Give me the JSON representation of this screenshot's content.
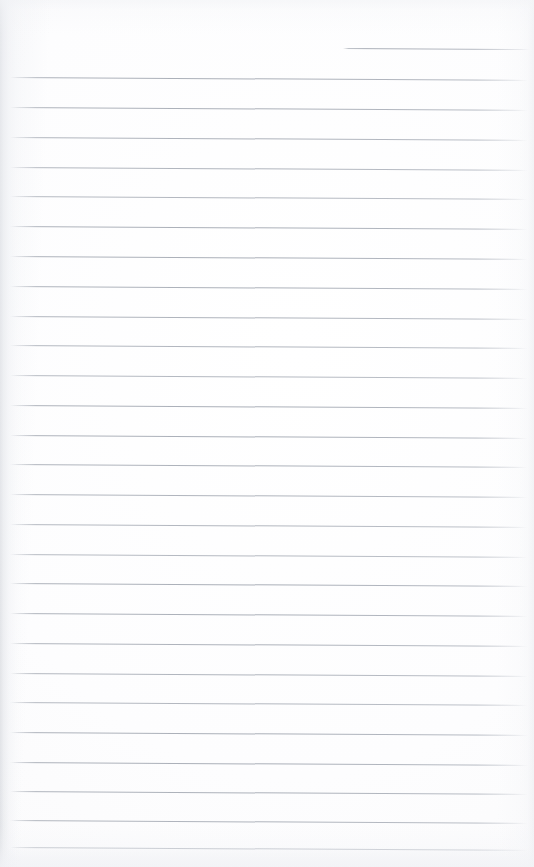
{
  "document": {
    "kind": "scanned-blank-ruled-notebook-page",
    "title": "Blank ruled notebook page",
    "has_visible_text": false,
    "written_content": "",
    "page_width": 534,
    "page_height": 867
  },
  "colors": {
    "paper": "#fdfdfe",
    "paper_edge": "#f8f8fa",
    "rule_line": "#aaafb8",
    "rule_line_faded": "#c4c7cd",
    "spine_shadow": "#c4c7cd"
  },
  "ruling": {
    "style": "wide-ruled-horizontal",
    "line_count": 27,
    "line_spacing_px": 30,
    "first_full_line_y": 77,
    "last_full_line_y": 847,
    "line_left_x": 10,
    "line_right_x": 528,
    "line_thickness_px": 1,
    "skew_px_over_width": 3,
    "lines": [
      {
        "y": 48,
        "left": 343,
        "right": 530,
        "partial": true
      },
      {
        "y": 77,
        "left": 10,
        "right": 528,
        "partial": false
      },
      {
        "y": 107,
        "left": 10,
        "right": 528,
        "partial": false
      },
      {
        "y": 137,
        "left": 10,
        "right": 528,
        "partial": false
      },
      {
        "y": 167,
        "left": 10,
        "right": 528,
        "partial": false
      },
      {
        "y": 196,
        "left": 10,
        "right": 528,
        "partial": false
      },
      {
        "y": 226,
        "left": 10,
        "right": 528,
        "partial": false
      },
      {
        "y": 256,
        "left": 10,
        "right": 528,
        "partial": false
      },
      {
        "y": 286,
        "left": 10,
        "right": 528,
        "partial": false
      },
      {
        "y": 316,
        "left": 10,
        "right": 528,
        "partial": false
      },
      {
        "y": 345,
        "left": 10,
        "right": 528,
        "partial": false
      },
      {
        "y": 375,
        "left": 10,
        "right": 528,
        "partial": false
      },
      {
        "y": 405,
        "left": 10,
        "right": 528,
        "partial": false
      },
      {
        "y": 435,
        "left": 10,
        "right": 528,
        "partial": false
      },
      {
        "y": 464,
        "left": 10,
        "right": 528,
        "partial": false
      },
      {
        "y": 494,
        "left": 10,
        "right": 528,
        "partial": false
      },
      {
        "y": 524,
        "left": 10,
        "right": 528,
        "partial": false
      },
      {
        "y": 554,
        "left": 10,
        "right": 528,
        "partial": false
      },
      {
        "y": 583,
        "left": 10,
        "right": 528,
        "partial": false
      },
      {
        "y": 613,
        "left": 10,
        "right": 528,
        "partial": false
      },
      {
        "y": 643,
        "left": 10,
        "right": 528,
        "partial": false
      },
      {
        "y": 673,
        "left": 10,
        "right": 528,
        "partial": false
      },
      {
        "y": 702,
        "left": 10,
        "right": 528,
        "partial": false
      },
      {
        "y": 732,
        "left": 10,
        "right": 528,
        "partial": false
      },
      {
        "y": 762,
        "left": 10,
        "right": 528,
        "partial": false
      },
      {
        "y": 791,
        "left": 10,
        "right": 528,
        "partial": false
      },
      {
        "y": 820,
        "left": 10,
        "right": 528,
        "partial": false
      },
      {
        "y": 847,
        "left": 10,
        "right": 528,
        "partial": false
      }
    ]
  }
}
